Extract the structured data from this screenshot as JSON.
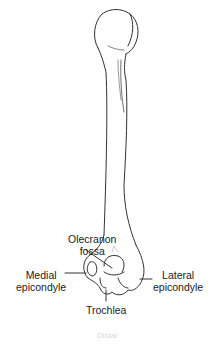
{
  "diagram": {
    "colors": {
      "line": "#333333",
      "text": "#1a1a1a",
      "background": "#ffffff"
    },
    "labels": {
      "olecranon_fossa": [
        "Olecranon",
        "fossa"
      ],
      "medial_epicondyle": [
        "Medial",
        "epicondyle"
      ],
      "lateral_epicondyle": [
        "Lateral",
        "epicondyle"
      ],
      "trochlea": "Trochlea"
    },
    "caption": "Distal"
  }
}
